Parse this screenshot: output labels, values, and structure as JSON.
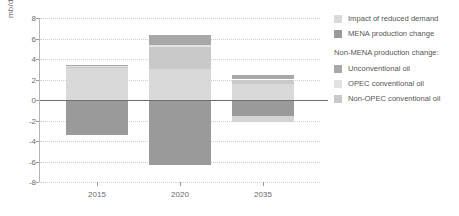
{
  "chart": {
    "ylabel": "mb/d",
    "xlabel": "",
    "title": ""
  },
  "legend": {
    "items_top": [
      {
        "label": "Impact of reduced demand",
        "color": "#d9d9d9",
        "swatch": "legend-swatch-reduced-demand"
      },
      {
        "label": "MENA production change",
        "color": "#9a9a9a",
        "swatch": "legend-swatch-mena"
      }
    ],
    "group_heading": "Non-MENA production change:",
    "items_group": [
      {
        "label": "Unconventional oil",
        "color": "#a8a8a8",
        "swatch": "legend-swatch-unconventional"
      },
      {
        "label": "OPEC conventional oil",
        "color": "#e2e2e2",
        "swatch": "legend-swatch-opec-conventional"
      },
      {
        "label": "Non-OPEC conventional oil",
        "color": "#c9c9c9",
        "swatch": "legend-swatch-nonopec-conventional"
      }
    ]
  },
  "chart_data": {
    "type": "bar",
    "subtype": "stacked-diverging",
    "title": "",
    "xlabel": "",
    "ylabel": "mb/d",
    "categories": [
      "2015",
      "2020",
      "2035"
    ],
    "ylim": [
      -8,
      8
    ],
    "yticks": [
      8,
      6,
      4,
      2,
      0,
      -2,
      -4,
      -6,
      -8
    ],
    "grid": true,
    "legend_position": "right",
    "series": [
      {
        "name": "Impact of reduced demand",
        "color": "#d9d9d9",
        "values": [
          3.1,
          3.05,
          1.55
        ]
      },
      {
        "name": "Non-OPEC conventional oil",
        "color": "#c9c9c9",
        "values": [
          0.1,
          2.1,
          0.45
        ]
      },
      {
        "name": "OPEC conventional oil",
        "color": "#e2e2e2",
        "values": [
          0.1,
          0.25,
          0.0
        ]
      },
      {
        "name": "Unconventional oil",
        "color": "#a8a8a8",
        "values": [
          0.1,
          0.9,
          0.45
        ]
      },
      {
        "name": "MENA production change",
        "color": "#9a9a9a",
        "values": [
          -3.4,
          -6.3,
          -1.6
        ]
      },
      {
        "name": "Non-OPEC conventional oil (negative)",
        "color": "#d3d3d3",
        "values": [
          0.0,
          0.0,
          -0.5
        ]
      }
    ],
    "totals_positive": [
      3.4,
      6.3,
      2.45
    ],
    "totals_negative": [
      -3.4,
      -6.3,
      -2.1
    ]
  },
  "colors": {
    "axis": "#6e6e6e",
    "grid": "#cfcfcf",
    "text": "#6b6b6b",
    "background": "#ffffff"
  }
}
